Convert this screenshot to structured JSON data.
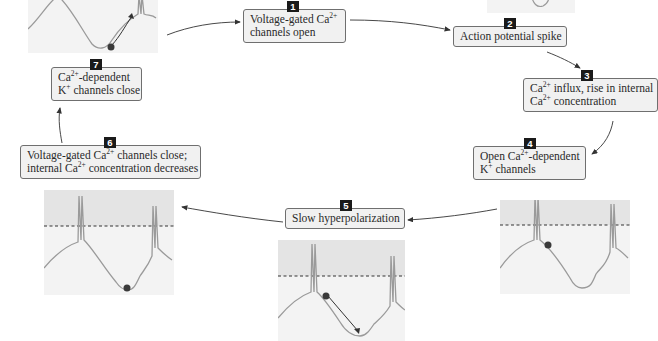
{
  "diagram": {
    "type": "cycle",
    "colors": {
      "box_fill": "#f1f1f1",
      "box_border": "#6f6f6f",
      "badge_fill": "#1a1a1a",
      "badge_text": "#ffffff",
      "panel_bg": "#f3f3f3",
      "panel_upper_bg": "#e4e4e4",
      "trace": "#9a9a9a",
      "threshold_line": "#333333",
      "marker_dot": "#3a3a3a",
      "arrow": "#333333"
    },
    "steps": [
      {
        "number": "1",
        "lines": [
          {
            "pre": "Voltage-gated Ca",
            "sup": "2+",
            "post": ""
          },
          {
            "pre": "channels open",
            "sup": "",
            "post": ""
          }
        ]
      },
      {
        "number": "2",
        "lines": [
          {
            "pre": "Action potential spike",
            "sup": "",
            "post": ""
          }
        ]
      },
      {
        "number": "3",
        "lines": [
          {
            "pre": "Ca",
            "sup": "2+",
            "post": " influx, rise in internal"
          },
          {
            "pre": "Ca",
            "sup": "2+",
            "post": " concentration"
          }
        ]
      },
      {
        "number": "4",
        "lines": [
          {
            "pre": "Open Ca",
            "sup": "2+",
            "post": "-dependent"
          },
          {
            "pre": "K",
            "sup": "+",
            "post": " channels"
          }
        ]
      },
      {
        "number": "5",
        "lines": [
          {
            "pre": "Slow hyperpolarization",
            "sup": "",
            "post": ""
          }
        ]
      },
      {
        "number": "6",
        "lines": [
          {
            "pre": "Voltage-gated Ca",
            "sup": "2+",
            "post": " channels close;"
          },
          {
            "pre": "internal Ca",
            "sup": "2+",
            "post": " concentration decreases"
          }
        ]
      },
      {
        "number": "7",
        "lines": [
          {
            "pre": "Ca",
            "sup": "2+",
            "post": "-dependent"
          },
          {
            "pre": "K",
            "sup": "+",
            "post": " channels close"
          }
        ]
      }
    ],
    "panels": [
      {
        "id": "top-left",
        "marker": "trough, arrow rising toward spike",
        "state": "partially cropped"
      },
      {
        "id": "top-right",
        "marker": "none visible",
        "state": "partially cropped"
      },
      {
        "id": "bottom-right",
        "marker": "just after spike burst"
      },
      {
        "id": "bottom-middle",
        "marker": "descending after spike, arrow to trough"
      },
      {
        "id": "bottom-left",
        "marker": "at trough"
      }
    ],
    "flow": [
      "1",
      "2",
      "3",
      "4",
      "5",
      "6",
      "7",
      "1"
    ]
  }
}
